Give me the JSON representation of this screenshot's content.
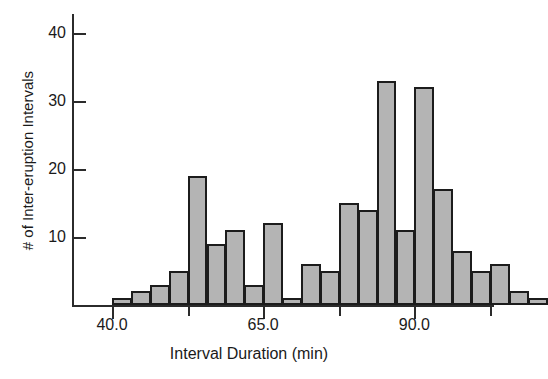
{
  "chart_data": {
    "type": "bar",
    "title": "",
    "xlabel": "Interval Duration (min)",
    "ylabel": "# of Inter-eruption Intervals",
    "grid": false,
    "legend": null,
    "xlim": [
      36.5,
      105.0
    ],
    "ylim": [
      0,
      44
    ],
    "xticks": [
      40.0,
      65.0,
      90.0
    ],
    "xtick_labels": [
      "40.0",
      "65.0",
      "90.0"
    ],
    "x_minor_ticks": [
      52.5,
      77.5,
      102.5
    ],
    "yticks": [
      10,
      20,
      30,
      40
    ],
    "ytick_labels": [
      "10",
      "20",
      "30",
      "40"
    ],
    "bin_width": 3.125,
    "bin_starts": [
      40.0,
      43.125,
      46.25,
      49.375,
      52.5,
      55.625,
      58.75,
      61.875,
      65.0,
      68.125,
      71.25,
      74.375,
      77.5,
      80.625,
      83.75,
      86.875,
      90.0,
      93.125,
      96.25,
      99.375
    ],
    "categories": [
      "40.0",
      "43.1",
      "46.3",
      "49.4",
      "52.5",
      "55.6",
      "58.8",
      "61.9",
      "65.0",
      "68.1",
      "71.3",
      "74.4",
      "77.5",
      "80.6",
      "83.8",
      "86.9",
      "90.0",
      "93.1",
      "96.3",
      "99.4"
    ],
    "values": [
      1,
      2,
      3,
      5,
      19,
      9,
      11,
      3,
      12,
      1,
      6,
      5,
      15,
      14,
      33,
      11,
      32,
      17,
      8,
      5
    ],
    "values_extra": [
      6,
      2,
      1
    ],
    "bar_fill_color": "#b4b4b4",
    "bar_edge_color": "#1c1c1c",
    "axis_color": "#2b2b2b",
    "text_color": "#1a1a1a"
  },
  "bars": [
    {
      "label": "40.0",
      "value": 1
    },
    {
      "label": "43.1",
      "value": 2
    },
    {
      "label": "46.3",
      "value": 3
    },
    {
      "label": "49.4",
      "value": 5
    },
    {
      "label": "52.5",
      "value": 19
    },
    {
      "label": "55.6",
      "value": 9
    },
    {
      "label": "58.8",
      "value": 11
    },
    {
      "label": "61.9",
      "value": 3
    },
    {
      "label": "65.0",
      "value": 12
    },
    {
      "label": "68.1",
      "value": 1
    },
    {
      "label": "71.3",
      "value": 6
    },
    {
      "label": "74.4",
      "value": 5
    },
    {
      "label": "77.5",
      "value": 15
    },
    {
      "label": "80.6",
      "value": 14
    },
    {
      "label": "83.8",
      "value": 33
    },
    {
      "label": "86.9",
      "value": 11
    },
    {
      "label": "90.0",
      "value": 32
    },
    {
      "label": "93.1",
      "value": 17
    },
    {
      "label": "96.3",
      "value": 8
    },
    {
      "label": "99.4",
      "value": 5
    },
    {
      "label": "102.5",
      "value": 6
    },
    {
      "label": "105.6",
      "value": 2
    },
    {
      "label": "108.8",
      "value": 1
    }
  ],
  "axes": {
    "ylabel": "# of Inter-eruption Intervals",
    "xlabel": "Interval Duration (min)",
    "ytick_labels": [
      "40",
      "30",
      "20",
      "10"
    ],
    "xtick_labels": [
      "40.0",
      "65.0",
      "90.0"
    ]
  }
}
